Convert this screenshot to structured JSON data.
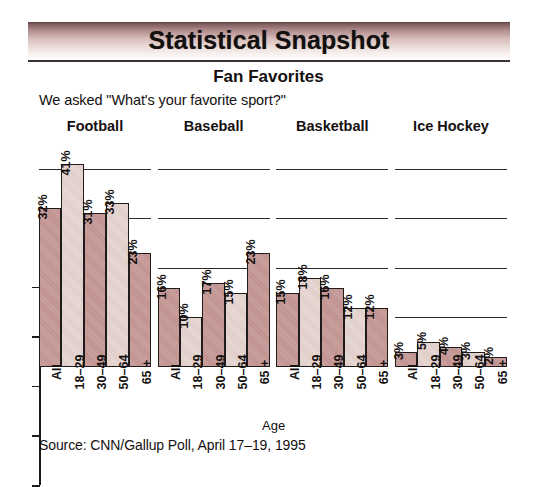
{
  "banner": {
    "title": "Statistical Snapshot"
  },
  "header": {
    "subtitle": "Fan Favorites",
    "question": "We asked \"What's your favorite sport?\""
  },
  "source": {
    "text": "Source: CNN/Gallup Poll, April 17–19, 1995"
  },
  "colors": {
    "bar_dark": "#c0908e",
    "bar_light": "#e8dad5",
    "bar_outline": "#211c1c",
    "banner_top": "#5d3f41",
    "banner_bottom": "#fdfbfa",
    "rule": "#3b3232",
    "text": "#141010"
  },
  "chart_data": {
    "type": "bar",
    "title": "Fan Favorites",
    "subtitle": "We asked \"What's your favorite sport?\"",
    "xlabel": "Age",
    "ylabel": "",
    "ylim": [
      0,
      45
    ],
    "grid": true,
    "gridlines": [
      10,
      20,
      30,
      40
    ],
    "legend_position": "none",
    "value_suffix": "%",
    "categories": [
      "All",
      "18–29",
      "30–49",
      "50–64",
      "65 +"
    ],
    "panels": [
      {
        "name": "Football",
        "values": [
          32,
          41,
          31,
          33,
          23
        ],
        "labels": [
          "32%",
          "41%",
          "31%",
          "33%",
          "23%"
        ],
        "shades": [
          "dark",
          "light",
          "dark",
          "light",
          "dark"
        ]
      },
      {
        "name": "Baseball",
        "values": [
          16,
          10,
          17,
          15,
          23
        ],
        "labels": [
          "16%",
          "10%",
          "17%",
          "15%",
          "23%"
        ],
        "shades": [
          "dark",
          "light",
          "dark",
          "light",
          "dark"
        ]
      },
      {
        "name": "Basketball",
        "values": [
          15,
          18,
          16,
          12,
          12
        ],
        "labels": [
          "15%",
          "18%",
          "16%",
          "12%",
          "12%"
        ],
        "shades": [
          "dark",
          "light",
          "dark",
          "light",
          "dark"
        ]
      },
      {
        "name": "Ice Hockey",
        "values": [
          3,
          5,
          4,
          3,
          2
        ],
        "labels": [
          "3%",
          "5%",
          "4%",
          "3%",
          "2%"
        ],
        "shades": [
          "dark",
          "light",
          "dark",
          "light",
          "dark"
        ]
      }
    ]
  }
}
